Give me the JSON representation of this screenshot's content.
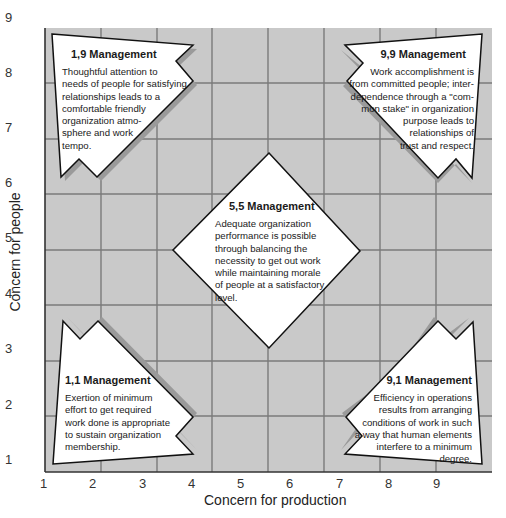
{
  "diagram": {
    "type": "managerial-grid",
    "colors": {
      "grid_background": "#c9c9c9",
      "grid_lines": "#7a7a7a",
      "shape_fill": "#ffffff",
      "shape_stroke": "#111111",
      "shadow": "#9a9a9a"
    },
    "x_axis": {
      "title": "Concern for production",
      "ticks": [
        "1",
        "2",
        "3",
        "4",
        "5",
        "6",
        "7",
        "8",
        "9"
      ]
    },
    "y_axis": {
      "title": "Concern for people",
      "ticks": [
        "9",
        "8",
        "7",
        "6",
        "5",
        "4",
        "3",
        "2",
        "1"
      ]
    },
    "styles": [
      {
        "id": "1,9",
        "title": "1,9 Management",
        "description": [
          "Thoughtful attention to",
          "needs of people for satisfying",
          "relationships leads to a",
          "comfortable friendly",
          "organization atmo-",
          "sphere and work",
          "tempo."
        ]
      },
      {
        "id": "9,9",
        "title": "9,9 Management",
        "description": [
          "Work accomplishment is",
          "from committed people; inter-",
          "dependence through a \"com-",
          "mon stake\" in organization",
          "purpose leads to",
          "relationships of",
          "trust and respect."
        ]
      },
      {
        "id": "5,5",
        "title": "5,5 Management",
        "description": [
          "Adequate organization",
          "performance is possible",
          "through balancing the",
          "necessity to get out work",
          "while maintaining morale",
          "of people at a satisfactory",
          "level."
        ]
      },
      {
        "id": "1,1",
        "title": "1,1 Management",
        "description": [
          "Exertion of minimum",
          "effort to get required",
          "work done is appropriate",
          "to sustain organization",
          "membership."
        ]
      },
      {
        "id": "9,1",
        "title": "9,1 Management",
        "description": [
          "Efficiency in operations",
          "results from arranging",
          "conditions of work in such",
          "a way that human elements",
          "interfere to a minimum",
          "degree."
        ]
      }
    ]
  }
}
